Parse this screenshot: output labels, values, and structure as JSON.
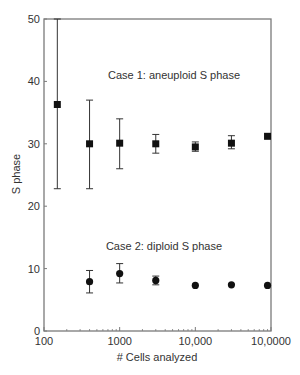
{
  "chart_data": {
    "type": "scatter",
    "title": "",
    "xlabel": "# Cells analyzed",
    "ylabel": "S phase",
    "xscale": "log",
    "xlim": [
      100,
      100000
    ],
    "ylim": [
      0,
      50
    ],
    "x_tick_values": [
      100,
      1000,
      10000,
      100000
    ],
    "x_tick_labels": [
      "100",
      "1000",
      "10,000",
      "10,0000"
    ],
    "y_ticks": [
      0,
      10,
      20,
      30,
      40,
      50
    ],
    "grid": false,
    "legend": "none",
    "annotations": [
      {
        "text": "Case 1: aneuploid S phase",
        "x": 1000,
        "y": 40
      },
      {
        "text": "Case 2: diploid S phase",
        "x": 1000,
        "y": 13.5
      }
    ],
    "series": [
      {
        "name": "Case 1: aneuploid S phase",
        "marker": "square",
        "x": [
          150,
          400,
          1000,
          3000,
          10000,
          30000,
          90000
        ],
        "y": [
          36.3,
          30.0,
          30.1,
          30.0,
          29.5,
          30.1,
          31.2
        ],
        "err_low": [
          22.8,
          22.8,
          26.0,
          28.5,
          28.8,
          29.2,
          null
        ],
        "err_high": [
          50.0,
          37.0,
          34.0,
          31.5,
          30.3,
          31.3,
          null
        ]
      },
      {
        "name": "Case 2: diploid S phase",
        "marker": "circle",
        "x": [
          400,
          1000,
          3000,
          10000,
          30000,
          90000
        ],
        "y": [
          7.9,
          9.2,
          8.1,
          7.3,
          7.4,
          7.3
        ],
        "err_low": [
          6.1,
          7.7,
          7.4,
          null,
          null,
          null
        ],
        "err_high": [
          9.7,
          10.8,
          8.8,
          null,
          null,
          null
        ]
      }
    ]
  },
  "labels": {
    "xlabel": "# Cells analyzed",
    "ylabel": "S phase",
    "annotation_case1": "Case 1: aneuploid S phase",
    "annotation_case2": "Case 2: diploid S phase"
  },
  "colors": {
    "axis": "#7a7a7a",
    "marker": "#111111",
    "text": "#333333"
  }
}
